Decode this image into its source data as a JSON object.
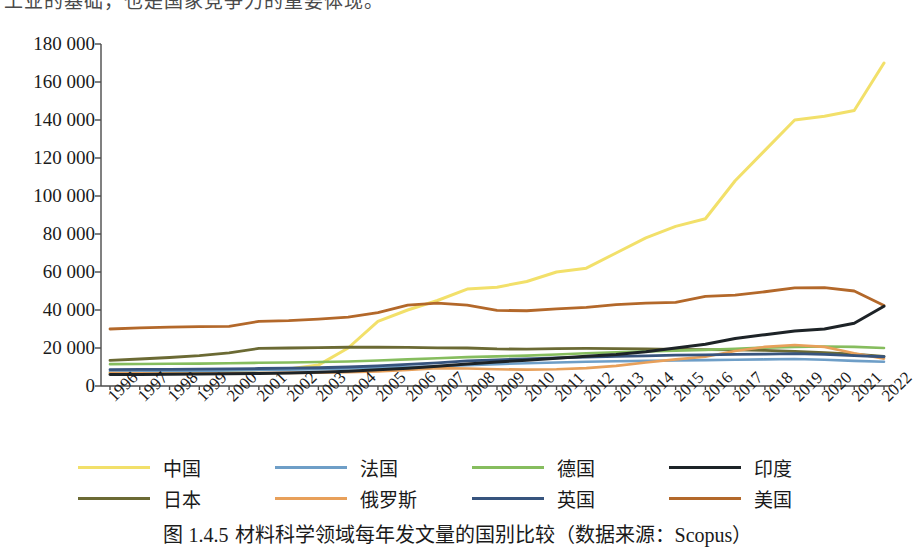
{
  "top_sliver": {
    "text": "工业的基础，也是国家竞争力的重要体现。"
  },
  "caption": {
    "prefix": "图",
    "number": "1.4.5",
    "text": "材料科学领域每年发文量的国别比较（数据来源：Scopus）"
  },
  "chart_data": {
    "type": "line",
    "title": "",
    "xlabel": "",
    "ylabel": "",
    "grid": false,
    "legend_position": "bottom",
    "xlim": [
      1996,
      2022
    ],
    "ylim": [
      0,
      180000
    ],
    "ytick_step": 20000,
    "ytick_labels": [
      "180 000",
      "160 000",
      "140 000",
      "120 000",
      "100 000",
      "80 000",
      "60 000",
      "40 000",
      "20 000",
      "0"
    ],
    "ytick_values": [
      180000,
      160000,
      140000,
      120000,
      100000,
      80000,
      60000,
      40000,
      20000,
      0
    ],
    "x": [
      1996,
      1997,
      1998,
      1999,
      2000,
      2001,
      2002,
      2003,
      2004,
      2005,
      2006,
      2007,
      2008,
      2009,
      2010,
      2011,
      2012,
      2013,
      2014,
      2015,
      2016,
      2017,
      2018,
      2019,
      2020,
      2021,
      2022
    ],
    "xtick_labels": [
      "1996",
      "1997",
      "1998",
      "1999",
      "2000",
      "2001",
      "2002",
      "2003",
      "2004",
      "2005",
      "2006",
      "2007",
      "2008",
      "2009",
      "2010",
      "2011",
      "2012",
      "2013",
      "2014",
      "2015",
      "2016",
      "2017",
      "2018",
      "2019",
      "2020",
      "2021",
      "2022"
    ],
    "series": [
      {
        "name": "中国",
        "key": "china",
        "color": "#f2e06a",
        "width": 3.0,
        "values": [
          7000,
          7200,
          7500,
          7800,
          8200,
          8500,
          9000,
          11000,
          20000,
          34000,
          40000,
          45000,
          51000,
          52000,
          55000,
          60000,
          62000,
          70000,
          78000,
          84000,
          88000,
          108000,
          124000,
          140000,
          142000,
          145000,
          170000
        ]
      },
      {
        "name": "法国",
        "key": "france",
        "color": "#6e9ec7",
        "width": 2.6,
        "values": [
          7600,
          7700,
          7800,
          7900,
          8200,
          8400,
          8600,
          8800,
          9200,
          9600,
          10000,
          10400,
          11000,
          11500,
          12000,
          12400,
          12800,
          13000,
          13200,
          13400,
          13600,
          13800,
          14000,
          14200,
          13800,
          13200,
          12800
        ]
      },
      {
        "name": "德国",
        "key": "germany",
        "color": "#86bd5e",
        "width": 2.6,
        "values": [
          11500,
          11600,
          11700,
          11800,
          12000,
          12200,
          12400,
          12600,
          12900,
          13400,
          14000,
          14600,
          15200,
          15600,
          16000,
          16600,
          17200,
          17800,
          18200,
          18600,
          19000,
          19600,
          20200,
          20600,
          20800,
          20600,
          20000
        ]
      },
      {
        "name": "印度",
        "key": "india",
        "color": "#1d2327",
        "width": 3.0,
        "values": [
          6000,
          6100,
          6200,
          6300,
          6400,
          6600,
          6900,
          7300,
          7800,
          8600,
          9400,
          10400,
          11600,
          12600,
          13600,
          14600,
          15600,
          16600,
          18000,
          20000,
          22000,
          25000,
          27000,
          29000,
          30000,
          33000,
          42000
        ]
      },
      {
        "name": "日本",
        "key": "japan",
        "color": "#6b6a34",
        "width": 2.8,
        "values": [
          13500,
          14200,
          15000,
          16000,
          17400,
          19800,
          20000,
          20200,
          20400,
          20400,
          20300,
          20100,
          20000,
          19500,
          19400,
          19700,
          19800,
          19700,
          19500,
          19300,
          19100,
          19000,
          18800,
          18200,
          17600,
          16800,
          15600
        ]
      },
      {
        "name": "俄罗斯",
        "key": "russia",
        "color": "#e8a05a",
        "width": 2.6,
        "values": [
          6800,
          6700,
          6600,
          6600,
          6700,
          6800,
          6900,
          7000,
          7200,
          7600,
          8400,
          9400,
          9200,
          8800,
          8600,
          8800,
          9400,
          10600,
          12400,
          14000,
          15400,
          18400,
          20600,
          21600,
          20600,
          17200,
          14400
        ]
      },
      {
        "name": "英国",
        "key": "uk",
        "color": "#37547e",
        "width": 2.8,
        "values": [
          8600,
          8700,
          8800,
          8900,
          9000,
          9200,
          9400,
          9600,
          10000,
          10600,
          11400,
          12200,
          13200,
          13800,
          14200,
          14800,
          15200,
          15600,
          15900,
          16200,
          16400,
          16600,
          16800,
          17000,
          16600,
          16000,
          15400
        ]
      },
      {
        "name": "美国",
        "key": "usa",
        "color": "#b3682a",
        "width": 2.8,
        "values": [
          30000,
          30600,
          31000,
          31200,
          31400,
          34000,
          34400,
          35200,
          36200,
          38600,
          42600,
          43600,
          42600,
          39800,
          39600,
          40600,
          41400,
          42800,
          43600,
          44000,
          47200,
          47800,
          49600,
          51600,
          51800,
          50000,
          42400
        ]
      }
    ]
  },
  "legend": {
    "rows": [
      [
        {
          "label": "中国",
          "color": "#f2e06a",
          "key": "china"
        },
        {
          "label": "法国",
          "color": "#6e9ec7",
          "key": "france"
        },
        {
          "label": "德国",
          "color": "#86bd5e",
          "key": "germany"
        },
        {
          "label": "印度",
          "color": "#1d2327",
          "key": "india"
        }
      ],
      [
        {
          "label": "日本",
          "color": "#6b6a34",
          "key": "japan"
        },
        {
          "label": "俄罗斯",
          "color": "#e8a05a",
          "key": "russia"
        },
        {
          "label": "英国",
          "color": "#37547e",
          "key": "uk"
        },
        {
          "label": "美国",
          "color": "#b3682a",
          "key": "usa"
        }
      ]
    ]
  },
  "axis_style": {
    "color": "#4a4a4a",
    "width": 1.4
  }
}
